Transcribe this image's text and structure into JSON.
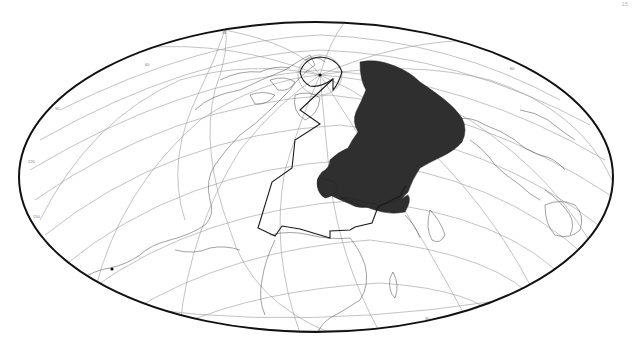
{
  "page": {
    "page_number": "15"
  },
  "map": {
    "projection": "oblique-hammer",
    "frame": {
      "cx": 316,
      "cy": 177,
      "rx": 297,
      "ry": 155
    },
    "colors": {
      "background": "#ffffff",
      "border": "#111111",
      "graticule": "#9a9a9a",
      "coastline": "#555555",
      "shaded_region": "#2f2f2f",
      "zone_outline": "#1a1a1a"
    },
    "features": {
      "pole_cap": {
        "label": "north-pole-cap",
        "marker": "dot"
      },
      "shaded_region": {
        "label": "Europe and western Russia (shaded)"
      },
      "zone_outline": {
        "label": "outlined study zone from pole to North Africa"
      },
      "point_markers": [
        {
          "label": "pole-dot",
          "x": 320,
          "y": 75
        },
        {
          "label": "southern-dot",
          "x": 112,
          "y": 269
        }
      ]
    },
    "graticule_labels": [
      "30",
      "60",
      "90",
      "120",
      "150",
      "180",
      "0",
      "30",
      "60"
    ]
  }
}
